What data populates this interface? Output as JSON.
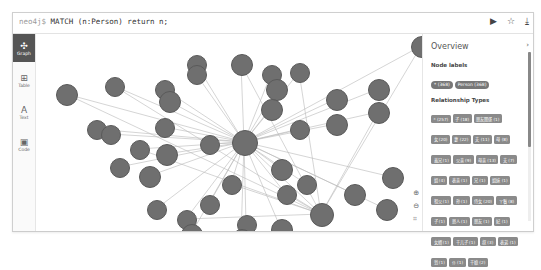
{
  "editor": {
    "prompt": "neo4j$",
    "query": "MATCH (n:Person) return n;",
    "actions": [
      {
        "name": "run-icon",
        "glyph": "▶"
      },
      {
        "name": "star-icon",
        "glyph": "☆"
      },
      {
        "name": "download-icon",
        "glyph": "⤓"
      }
    ]
  },
  "sidebar": {
    "items": [
      {
        "label": "Graph",
        "icon": "✣",
        "active": true
      },
      {
        "label": "Table",
        "icon": "⊞",
        "active": false
      },
      {
        "label": "Text",
        "icon": "A",
        "active": false
      },
      {
        "label": "Code",
        "icon": "▣",
        "active": false
      }
    ]
  },
  "graph": {
    "center": {
      "x": 208,
      "y": 108
    },
    "hub2": {
      "x": 285,
      "y": 180
    },
    "nodes": [
      {
        "x": 30,
        "y": 60,
        "r": 10
      },
      {
        "x": 60,
        "y": 95,
        "r": 9
      },
      {
        "x": 74,
        "y": 100,
        "r": 9
      },
      {
        "x": 83,
        "y": 133,
        "r": 9
      },
      {
        "x": 78,
        "y": 52,
        "r": 9
      },
      {
        "x": 128,
        "y": 55,
        "r": 9
      },
      {
        "x": 133,
        "y": 67,
        "r": 10
      },
      {
        "x": 128,
        "y": 93,
        "r": 9
      },
      {
        "x": 103,
        "y": 115,
        "r": 9
      },
      {
        "x": 113,
        "y": 142,
        "r": 10
      },
      {
        "x": 130,
        "y": 120,
        "r": 10
      },
      {
        "x": 120,
        "y": 175,
        "r": 9
      },
      {
        "x": 150,
        "y": 185,
        "r": 9
      },
      {
        "x": 160,
        "y": 30,
        "r": 9
      },
      {
        "x": 160,
        "y": 40,
        "r": 9
      },
      {
        "x": 173,
        "y": 110,
        "r": 9
      },
      {
        "x": 195,
        "y": 150,
        "r": 9
      },
      {
        "x": 210,
        "y": 190,
        "r": 9
      },
      {
        "x": 173,
        "y": 170,
        "r": 9
      },
      {
        "x": 155,
        "y": 200,
        "r": 10
      },
      {
        "x": 205,
        "y": 30,
        "r": 10
      },
      {
        "x": 235,
        "y": 40,
        "r": 9
      },
      {
        "x": 240,
        "y": 55,
        "r": 10
      },
      {
        "x": 235,
        "y": 75,
        "r": 10
      },
      {
        "x": 263,
        "y": 38,
        "r": 9
      },
      {
        "x": 263,
        "y": 95,
        "r": 9
      },
      {
        "x": 245,
        "y": 135,
        "r": 10
      },
      {
        "x": 270,
        "y": 150,
        "r": 9
      },
      {
        "x": 250,
        "y": 160,
        "r": 9
      },
      {
        "x": 300,
        "y": 90,
        "r": 10
      },
      {
        "x": 300,
        "y": 65,
        "r": 10
      },
      {
        "x": 342,
        "y": 55,
        "r": 10
      },
      {
        "x": 342,
        "y": 78,
        "r": 10
      },
      {
        "x": 318,
        "y": 160,
        "r": 10
      },
      {
        "x": 356,
        "y": 143,
        "r": 10
      },
      {
        "x": 350,
        "y": 175,
        "r": 10
      },
      {
        "x": 385,
        "y": 12,
        "r": 10
      },
      {
        "x": 245,
        "y": 195,
        "r": 10
      },
      {
        "x": 205,
        "y": 205,
        "r": 10
      }
    ],
    "zoom_controls": [
      {
        "name": "zoom-in-icon",
        "glyph": "⊕"
      },
      {
        "name": "zoom-out-icon",
        "glyph": "⊖"
      },
      {
        "name": "fit-icon",
        "glyph": "⌗"
      }
    ]
  },
  "overview": {
    "title": "Overview",
    "node_labels_heading": "Node labels",
    "node_labels": [
      "* (368)",
      "Person (368)"
    ],
    "relationship_types_heading": "Relationship Types",
    "relationship_types": [
      "* (257)",
      "子 (18)",
      "朋友関係 (1)",
      "女 (20)",
      "妻 (22)",
      "夫 (11)",
      "母 (8)",
      "義兄 (1)",
      "父亲 (9)",
      "母亲 (13)",
      "夫 (7)",
      "姐 (4)",
      "表亲 (1)",
      "兄 (1)",
      "姐妹 (1)",
      "祖父 (1)",
      "孙 (1)",
      "侍女 (20)",
      "丫鬟 (8)",
      "子 (1)",
      "恩人 (1)",
      "朋友 (1)",
      "妃 (1)",
      "女婿 (1)",
      "干儿子 (1)",
      "叔 (3)",
      "表弟 (1)",
      "翁 (1)",
      "仆 (1)",
      "干娘 (2)"
    ]
  }
}
